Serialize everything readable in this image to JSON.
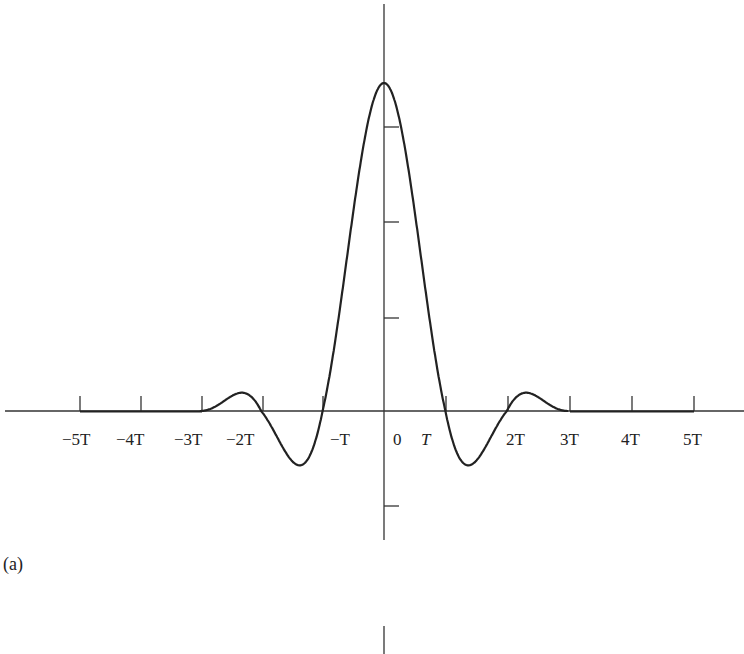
{
  "chart_data": {
    "type": "line",
    "title": "",
    "panel_label": "(a)",
    "xlabel": "",
    "ylabel": "",
    "x_tick_labels": [
      "-5T",
      "-4T",
      "-3T",
      "-2T",
      "-T",
      "0",
      "T",
      "2T",
      "3T",
      "4T",
      "5T"
    ],
    "x_ticks_units_T": [
      -5,
      -4,
      -3,
      -2,
      -1,
      0,
      1,
      2,
      3,
      4,
      5
    ],
    "xlim_T": [
      -6.2,
      5.9
    ],
    "x": [
      -5,
      -4,
      -3,
      -2.5,
      -2,
      -1.5,
      -1,
      -0.5,
      0,
      0.5,
      1,
      1.5,
      2,
      2.5,
      3,
      4,
      5
    ],
    "y": [
      0,
      0,
      0,
      0.058,
      0,
      -0.152,
      0,
      0.6,
      1.0,
      0.6,
      0,
      -0.152,
      0,
      0.058,
      0,
      0,
      0
    ],
    "y_ticks_relative": [
      -0.29,
      0.29,
      0.58,
      0.87
    ],
    "grid": false,
    "legend": null,
    "lower_panel_fragment": "vertical axis segment of next panel (b)"
  },
  "labels": {
    "panel": "(a)",
    "neg5T": "−5T",
    "neg4T": "−4T",
    "neg3T": "−3T",
    "neg2T": "−2T",
    "negT": "−T",
    "zero": "0",
    "T": "T",
    "pos2T": "2T",
    "pos3T": "3T",
    "pos4T": "4T",
    "pos5T": "5T"
  }
}
